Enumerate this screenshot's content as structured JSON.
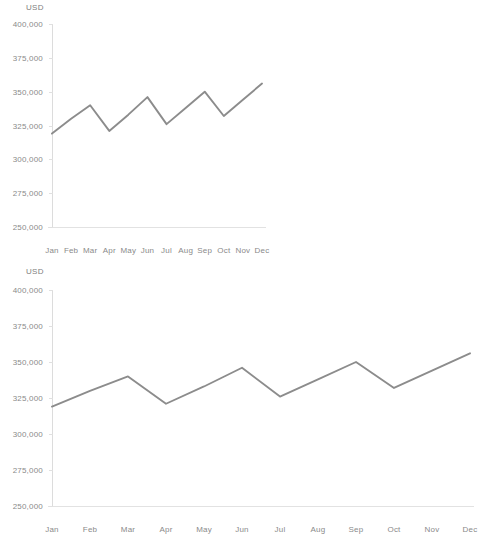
{
  "page": {
    "background": "#ffffff",
    "line_color": "#8c8c8c",
    "axis_color": "#dcdcdc",
    "text_color": "#8a8a8a"
  },
  "chart_data": [
    {
      "type": "line",
      "title": "",
      "subtitle": "",
      "xlabel": "",
      "ylabel": "USD",
      "unit_label": "USD",
      "categories": [
        "Jan",
        "Feb",
        "Mar",
        "Apr",
        "May",
        "Jun",
        "Jul",
        "Aug",
        "Sep",
        "Oct",
        "Nov",
        "Dec"
      ],
      "values": [
        319000,
        330000,
        340000,
        321000,
        333000,
        346000,
        326000,
        338000,
        350000,
        332000,
        344000,
        356000
      ],
      "ylim": [
        250000,
        400000
      ],
      "ytick_values": [
        400000,
        375000,
        350000,
        325000,
        300000,
        275000,
        250000
      ],
      "ytick_labels": [
        "400,000",
        "375,000",
        "350,000",
        "325,000",
        "300,000",
        "275,000",
        "250,000"
      ],
      "grid": false,
      "legend": null,
      "series": [
        {
          "name": "USD",
          "color": "#8c8c8c",
          "values": [
            319000,
            330000,
            340000,
            321000,
            333000,
            346000,
            326000,
            338000,
            350000,
            332000,
            344000,
            356000
          ]
        }
      ]
    },
    {
      "type": "line",
      "title": "",
      "subtitle": "",
      "xlabel": "",
      "ylabel": "USD",
      "unit_label": "USD",
      "categories": [
        "Jan",
        "Feb",
        "Mar",
        "Apr",
        "May",
        "Jun",
        "Jul",
        "Aug",
        "Sep",
        "Oct",
        "Nov",
        "Dec"
      ],
      "values": [
        319000,
        330000,
        340000,
        321000,
        333000,
        346000,
        326000,
        338000,
        350000,
        332000,
        344000,
        356000
      ],
      "ylim": [
        250000,
        400000
      ],
      "ytick_values": [
        400000,
        375000,
        350000,
        325000,
        300000,
        275000,
        250000
      ],
      "ytick_labels": [
        "400,000",
        "375,000",
        "350,000",
        "325,000",
        "300,000",
        "275,000",
        "250,000"
      ],
      "grid": false,
      "legend": null,
      "series": [
        {
          "name": "USD",
          "color": "#8c8c8c",
          "values": [
            319000,
            330000,
            340000,
            321000,
            333000,
            346000,
            326000,
            338000,
            350000,
            332000,
            344000,
            356000
          ]
        }
      ]
    }
  ]
}
